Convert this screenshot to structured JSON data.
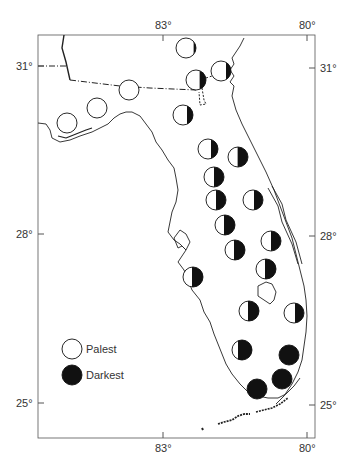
{
  "map": {
    "frame": {
      "left": 38,
      "top": 35,
      "right": 315,
      "bottom": 438
    },
    "longitude_ticks": [
      {
        "label": "83°",
        "x": 163
      },
      {
        "label": "80°",
        "x": 307
      }
    ],
    "latitude_ticks": [
      {
        "label": "31°",
        "y": 66
      },
      {
        "label": "28°",
        "y": 234
      },
      {
        "label": "25°",
        "y": 403
      }
    ],
    "circle_radius": 10,
    "sites": [
      {
        "x": 186,
        "y": 48,
        "dark": 0.12
      },
      {
        "x": 221,
        "y": 71,
        "dark": 0.25
      },
      {
        "x": 196,
        "y": 80,
        "dark": 0.32
      },
      {
        "x": 129,
        "y": 90,
        "dark": 0.0
      },
      {
        "x": 97,
        "y": 108,
        "dark": 0.0
      },
      {
        "x": 67,
        "y": 123,
        "dark": 0.0
      },
      {
        "x": 183,
        "y": 115,
        "dark": 0.3
      },
      {
        "x": 208,
        "y": 149,
        "dark": 0.35
      },
      {
        "x": 238,
        "y": 157,
        "dark": 0.52
      },
      {
        "x": 214,
        "y": 177,
        "dark": 0.5
      },
      {
        "x": 216,
        "y": 200,
        "dark": 0.5
      },
      {
        "x": 253,
        "y": 200,
        "dark": 0.45
      },
      {
        "x": 225,
        "y": 225,
        "dark": 0.55
      },
      {
        "x": 271,
        "y": 241,
        "dark": 0.5
      },
      {
        "x": 235,
        "y": 250,
        "dark": 0.55
      },
      {
        "x": 266,
        "y": 269,
        "dark": 0.55
      },
      {
        "x": 193,
        "y": 277,
        "dark": 0.55
      },
      {
        "x": 249,
        "y": 311,
        "dark": 0.55
      },
      {
        "x": 294,
        "y": 313,
        "dark": 0.45
      },
      {
        "x": 242,
        "y": 350,
        "dark": 0.7
      },
      {
        "x": 289,
        "y": 355,
        "dark": 1.0
      },
      {
        "x": 282,
        "y": 379,
        "dark": 1.0
      },
      {
        "x": 257,
        "y": 389,
        "dark": 1.0
      }
    ],
    "legend": {
      "items": [
        {
          "label": "Palest",
          "dark": 0.0,
          "x": 72,
          "y": 349
        },
        {
          "label": "Darkest",
          "dark": 1.0,
          "x": 72,
          "y": 375
        }
      ]
    },
    "colors": {
      "ink": "#111111",
      "line": "#333333",
      "paper": "#ffffff"
    }
  }
}
